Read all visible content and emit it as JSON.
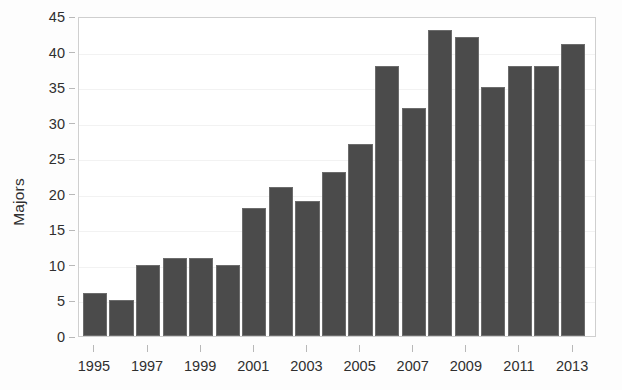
{
  "chart_data": {
    "type": "bar",
    "title": "",
    "subtitle": "",
    "xlabel": "",
    "ylabel": "Majors",
    "categories": [
      "1995",
      "1996",
      "1997",
      "1998",
      "1999",
      "2000",
      "2001",
      "2002",
      "2003",
      "2004",
      "2005",
      "2006",
      "2007",
      "2008",
      "2009",
      "2010",
      "2011",
      "2012",
      "2013"
    ],
    "values": [
      6,
      5,
      10,
      11,
      11,
      10,
      18,
      21,
      19,
      23,
      27,
      38,
      32,
      43,
      42,
      35,
      38,
      38,
      41
    ],
    "ylim": [
      0,
      45
    ],
    "xlim": [
      1994.4,
      2013.9
    ],
    "y_ticks": [
      0,
      5,
      10,
      15,
      20,
      25,
      30,
      35,
      40,
      45
    ],
    "y_tick_labels": [
      "0",
      "5",
      "10",
      "15",
      "20",
      "25",
      "30",
      "35",
      "40",
      "45"
    ],
    "x_tick_labels": [
      "1995",
      "1997",
      "1999",
      "2001",
      "2003",
      "2005",
      "2007",
      "2009",
      "2011",
      "2013"
    ],
    "x_tick_values": [
      1995,
      1997,
      1999,
      2001,
      2003,
      2005,
      2007,
      2009,
      2011,
      2013
    ],
    "grid": true,
    "grid_axis": "y",
    "legend": false,
    "legend_position": "none",
    "annotations": [],
    "colors": {
      "bar_fill": "#4b4b4b",
      "bar_stroke": "#6c6c6c",
      "grid": "#f2f2f2",
      "frame": "#cfcfcf",
      "text": "#2f2f2f",
      "plot_background": "#ffffff",
      "figure_background": "#fdfdfd"
    }
  }
}
